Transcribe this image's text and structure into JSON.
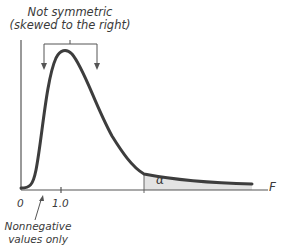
{
  "figure": {
    "annotation_top_line1": "Not symmetric",
    "annotation_top_line2": "(skewed to the right)",
    "x_axis_label": "F",
    "tick_zero": "0",
    "tick_one": "1.0",
    "annotation_bottom_line1": "Nonnegative",
    "annotation_bottom_line2": "values only",
    "tail_area_label": "α"
  },
  "colors": {
    "curve": "#3d3d3d",
    "axis": "#555555",
    "shade": "#e3e3e3",
    "text": "#3a3a3a"
  }
}
